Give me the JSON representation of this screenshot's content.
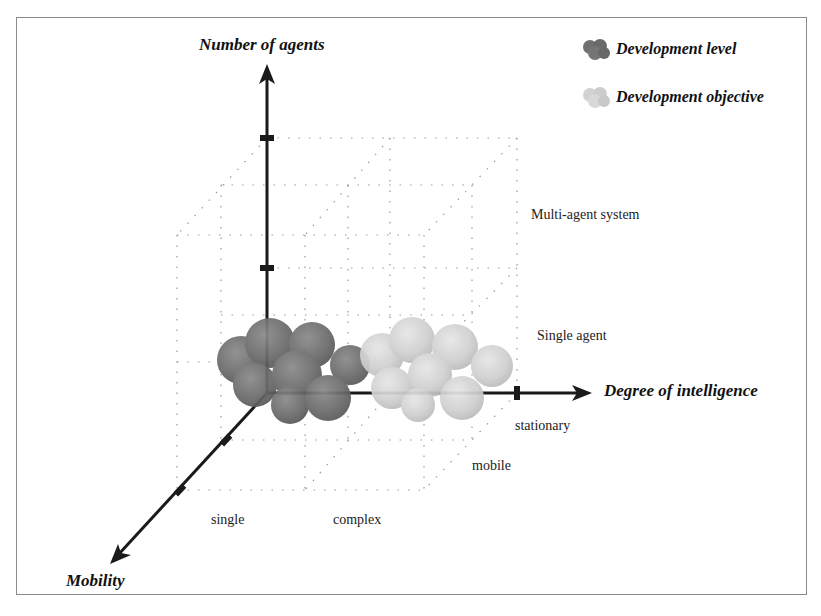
{
  "diagram": {
    "axes": {
      "vertical": {
        "title": "Number of agents",
        "levels": [
          "Single agent",
          "Multi-agent system"
        ]
      },
      "horizontal": {
        "title": "Degree of intelligence",
        "levels": [
          "single",
          "complex"
        ]
      },
      "depth": {
        "title": "Mobility",
        "levels": [
          "stationary",
          "mobile"
        ]
      }
    },
    "legend": [
      {
        "label": "Development level",
        "color": "#6f6f6f"
      },
      {
        "label": "Development objective",
        "color": "#d2d2d2"
      }
    ],
    "clusters": {
      "development_level": {
        "color": "#707070",
        "position": "single intelligence, single agent, stationary"
      },
      "development_objective": {
        "color": "#d0d0d0",
        "position": "complex intelligence, single agent, stationary"
      }
    },
    "colors": {
      "axis": "#1a1a1a",
      "grid": "#9a9a9a",
      "frame": "#8a8a8a"
    }
  }
}
